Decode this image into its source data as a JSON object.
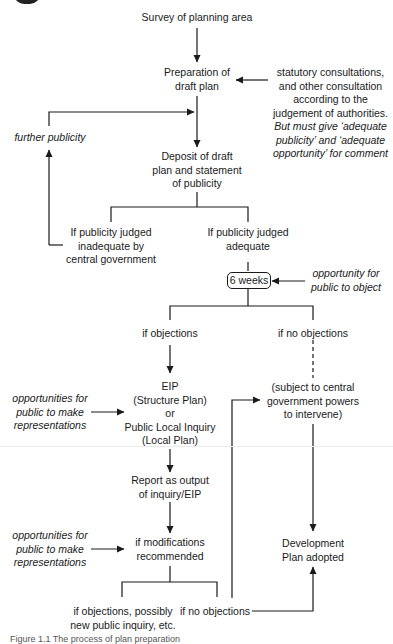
{
  "diagram": {
    "nodes": {
      "survey": "Survey of planning area",
      "prep_line1": "Preparation of",
      "prep_line2": "draft plan",
      "consult_line1": "statutory consultations,",
      "consult_line2": "and other consultation",
      "consult_line3": "according to the",
      "consult_line4": "judgement of authorities.",
      "consult_line5": "But must give ‘adequate",
      "consult_line6": "publicity’ and ‘adequate",
      "consult_line7": "opportunity’ for comment",
      "further_publicity": "further publicity",
      "deposit_line1": "Deposit of draft",
      "deposit_line2": "plan and statement",
      "deposit_line3": "of publicity",
      "inadequate_line1": "If publicity judged",
      "inadequate_line2": "inadequate by",
      "inadequate_line3": "central government",
      "adequate_line1": "If publicity judged",
      "adequate_line2": "adequate",
      "six_weeks": "6 weeks",
      "object_line1": "opportunity for",
      "object_line2": "public to object",
      "if_objections": "if objections",
      "if_no_objections": "if no objections",
      "eip_line1": "EIP",
      "eip_line2": "(Structure Plan)",
      "eip_line3": "or",
      "eip_line4": "Public Local Inquiry",
      "eip_line5": "(Local Plan)",
      "reps1_line1": "opportunities for",
      "reps1_line2": "public to make",
      "reps1_line3": "representations",
      "subject_line1": "(subject to central",
      "subject_line2": "government powers",
      "subject_line3": "to intervene)",
      "report_line1": "Report as output",
      "report_line2": "of inquiry/EIP",
      "reps2_line1": "opportunities for",
      "reps2_line2": "public to make",
      "reps2_line3": "representations",
      "modifications_line1": "if modifications",
      "modifications_line2": "recommended",
      "adopted_line1": "Development",
      "adopted_line2": "Plan adopted",
      "objections_inquiry_line1": "if objections, possibly",
      "objections_inquiry_line2": "new public inquiry, etc.",
      "final_no_objections": "if no objections"
    },
    "caption": "Figure 1.1   The process of plan preparation"
  }
}
